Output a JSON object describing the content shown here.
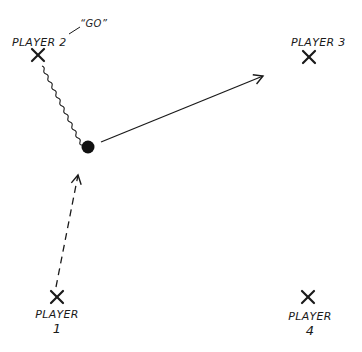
{
  "diagram": {
    "type": "play-diagram",
    "players": [
      {
        "id": 1,
        "label_line1": "PLAYER",
        "label_line2": "1",
        "marker": "x-icon",
        "x": 57,
        "y": 297
      },
      {
        "id": 2,
        "label": "PLAYER 2",
        "marker": "x-icon",
        "x": 38,
        "y": 55
      },
      {
        "id": 3,
        "label": "PLAYER 3",
        "marker": "x-icon",
        "x": 309,
        "y": 57
      },
      {
        "id": 4,
        "label_line1": "PLAYER",
        "label_line2": "4",
        "marker": "x-icon",
        "x": 308,
        "y": 297
      }
    ],
    "callout": {
      "text": "“GO”",
      "speaker": "PLAYER 2"
    },
    "ball": {
      "x": 88,
      "y": 147
    },
    "paths": [
      {
        "from": "PLAYER 2",
        "to": "ball",
        "style": "wavy",
        "meaning": "dribble"
      },
      {
        "from": "ball",
        "to": "PLAYER 3",
        "style": "solid-arrow",
        "meaning": "pass"
      },
      {
        "from": "PLAYER 1",
        "to": "ball",
        "style": "dashed-arrow",
        "meaning": "movement"
      }
    ],
    "colors": {
      "ink": "#1a1a1a",
      "background": "#ffffff"
    }
  }
}
